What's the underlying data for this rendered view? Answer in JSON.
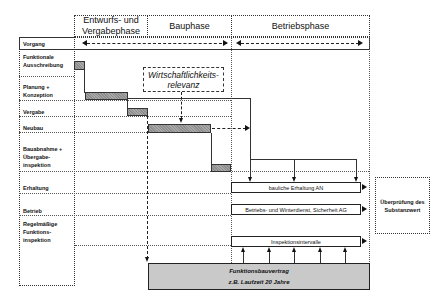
{
  "header": {
    "phases": [
      {
        "label": "Entwurfs- und Vergabephase"
      },
      {
        "label": "Bauphase"
      },
      {
        "label": "Betriebsphase"
      }
    ]
  },
  "rows": {
    "header_label": "Vorgang",
    "items": [
      {
        "label": "Funktionale Ausschreibung"
      },
      {
        "label": "Planung + Konzeption"
      },
      {
        "label": "Vergabe"
      },
      {
        "label": "Neubau"
      },
      {
        "label": "Bauabnahme + Übergabe-inspektion"
      },
      {
        "label": "Erhaltung"
      },
      {
        "label": "Betrieb"
      },
      {
        "label": "Regelmäßige Funktions-inspektion"
      }
    ]
  },
  "annotations": {
    "relevance": "Wirtschaftlichkeits-relevanz",
    "erhaltung_box": "bauliche Erhaltung AN",
    "betrieb_box": "Betriebs- und Winterdienst, Sicherheit AG",
    "inspektion_box": "Inspektionsintervalle",
    "contract_line1": "Funktionsbauvertrag",
    "contract_line2": "z.B. Laufzeit 20 Jahre",
    "check_box": "Überprüfung des Substanzwert"
  },
  "colors": {
    "bar_fill": "#9a9a9a",
    "contract_fill": "#c9c9c9",
    "line": "#222222"
  }
}
